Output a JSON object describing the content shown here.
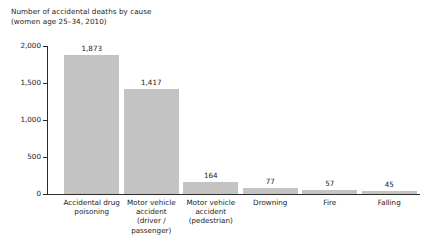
{
  "chart_data": {
    "type": "bar",
    "title": "Number of accidental deaths by cause\n(women age 25–34, 2010)",
    "xlabel": "",
    "ylabel": "",
    "ylim": [
      0,
      2000
    ],
    "grid": false,
    "legend": null,
    "categories": [
      "Accidental drug\npoisoning",
      "Motor vehicle\naccident\n(driver /\npassenger)",
      "Motor vehicle\naccident\n(pedestrian)",
      "Drowning",
      "Fire",
      "Falling"
    ],
    "values": [
      1873,
      1417,
      164,
      77,
      57,
      45
    ],
    "value_labels": [
      "1,873",
      "1,417",
      "164",
      "77",
      "57",
      "45"
    ],
    "yticks": [
      0,
      500,
      1000,
      1500,
      2000
    ],
    "ytick_labels": [
      "0",
      "500",
      "1,000",
      "1,500",
      "2,000"
    ],
    "bar_color": "#c3c3c3",
    "axis_color": "#2b2b2b",
    "background": "#ffffff"
  }
}
